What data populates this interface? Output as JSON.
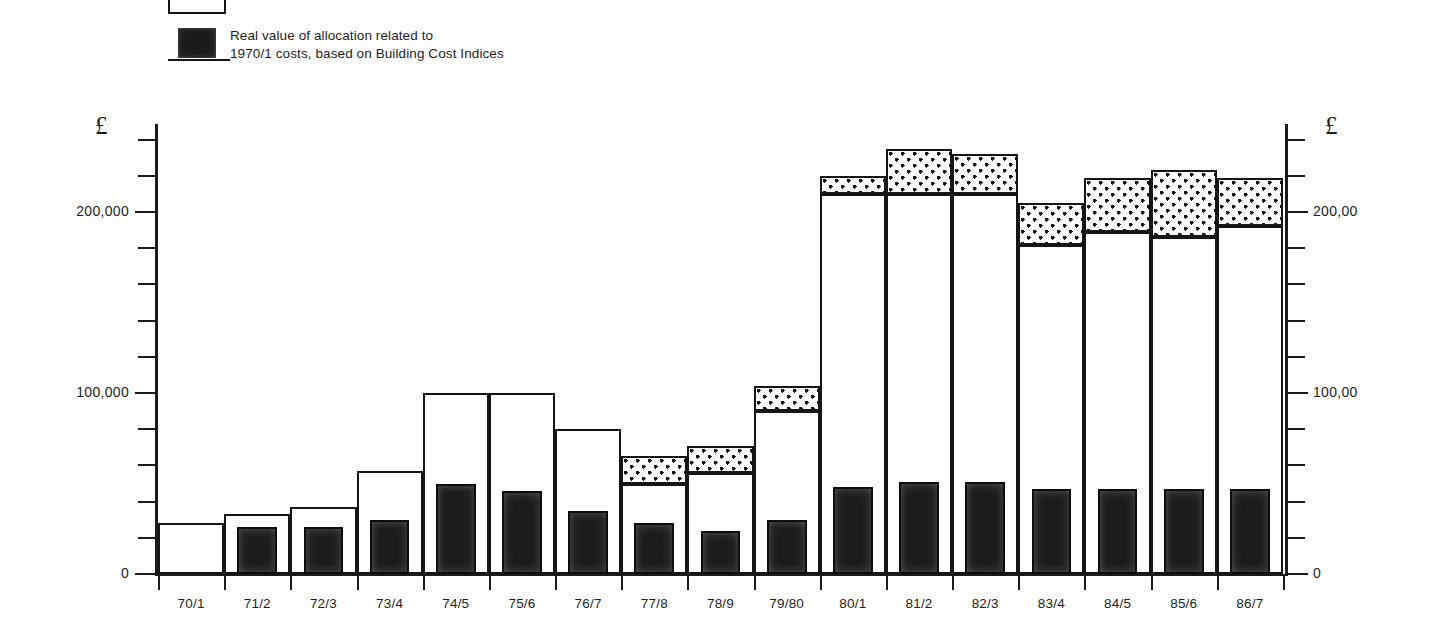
{
  "legend": {
    "items": [
      {
        "swatch": "open-rectangle",
        "lines": [
          "Conservation Fund"
        ]
      },
      {
        "swatch": "solid-black-rectangle",
        "lines": [
          "Real value of allocation related to",
          "1970/1 costs, based on Building Cost Indices"
        ]
      }
    ]
  },
  "axes": {
    "left": {
      "currency_symbol": "£",
      "tick_labels": [
        "200,000",
        "100,000",
        "0"
      ],
      "tick_values": [
        200000,
        100000,
        0
      ]
    },
    "right": {
      "currency_symbol": "£",
      "tick_labels": [
        "200,00",
        "100,00",
        "0"
      ],
      "tick_values": [
        200000,
        100000,
        0
      ]
    }
  },
  "chart_data": {
    "type": "bar",
    "title": "",
    "subtitle": "",
    "xlabel": "",
    "ylabel": "£",
    "ylim": [
      0,
      260000
    ],
    "grid": false,
    "stacked": true,
    "legend_position": "above-plot-left",
    "minor_tick_interval": 20000,
    "major_tick_interval": 100000,
    "categories": [
      "70/1",
      "71/2",
      "72/3",
      "73/4",
      "74/5",
      "75/6",
      "76/7",
      "77/8",
      "78/9",
      "79/80",
      "80/1",
      "81/2",
      "82/3",
      "83/4",
      "84/5",
      "85/6",
      "86/7"
    ],
    "series": [
      {
        "name": "Conservation Fund",
        "style": "open-rectangle",
        "values": [
          28000,
          33000,
          37000,
          57000,
          100000,
          100000,
          80000,
          50000,
          56000,
          90000,
          210000,
          210000,
          210000,
          182000,
          189000,
          186000,
          192000
        ]
      },
      {
        "name": "Conservation Fund (upper stippled portion)",
        "style": "stippled",
        "values": [
          0,
          0,
          0,
          0,
          0,
          0,
          0,
          15000,
          15000,
          14000,
          10000,
          25000,
          22000,
          23000,
          30000,
          37000,
          27000
        ]
      },
      {
        "name": "Real value of allocation related to 1970/1 costs, based on Building Cost Indices",
        "style": "solid-black",
        "values": [
          0,
          26000,
          26000,
          30000,
          50000,
          46000,
          35000,
          28000,
          24000,
          30000,
          48000,
          51000,
          51000,
          47000,
          47000,
          47000,
          47000
        ]
      }
    ],
    "series_totals": [
      28000,
      33000,
      37000,
      57000,
      100000,
      100000,
      80000,
      65000,
      71000,
      104000,
      220000,
      235000,
      232000,
      205000,
      219000,
      223000,
      219000
    ]
  }
}
